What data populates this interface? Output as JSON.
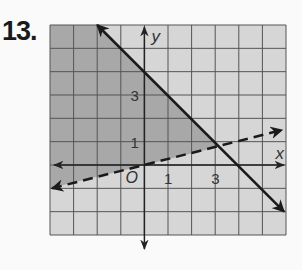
{
  "problem": {
    "number": "13."
  },
  "colors": {
    "background": "#fafafa",
    "grid_fill": "#d6d6d6",
    "shade_fill": "#a8a8a8",
    "grid_line": "#555555",
    "axis": "#222222",
    "line": "#1a1a1a"
  },
  "chart_data": {
    "type": "line",
    "title": "",
    "xlabel": "x",
    "ylabel": "y",
    "xlim": [
      -4,
      6
    ],
    "ylim": [
      -3,
      6
    ],
    "grid": true,
    "origin_label": "O",
    "x_tick_labels": [
      {
        "value": 1,
        "label": "1"
      },
      {
        "value": 3,
        "label": "3"
      }
    ],
    "y_tick_labels": [
      {
        "value": 1,
        "label": "1"
      },
      {
        "value": 3,
        "label": "3"
      }
    ],
    "series": [
      {
        "name": "boundary-solid",
        "style": "solid",
        "equation": "y = -x + 4",
        "slope": -1,
        "intercept": 4,
        "points": [
          [
            -2,
            6
          ],
          [
            6,
            -2
          ]
        ]
      },
      {
        "name": "boundary-dashed",
        "style": "dashed",
        "equation": "y = x/4",
        "slope": 0.25,
        "intercept": 0,
        "points": [
          [
            -4,
            -1
          ],
          [
            6,
            1.5
          ]
        ]
      }
    ],
    "shaded_region": "y <= -x + 4 and y > x/4",
    "legend": []
  }
}
